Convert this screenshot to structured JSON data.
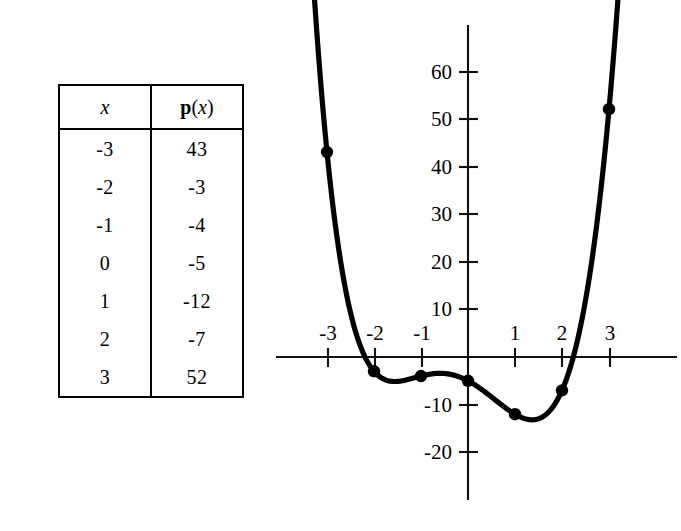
{
  "table": {
    "headers": [
      "x",
      "p(x)"
    ],
    "header_x": "x",
    "header_p_bold": "p",
    "header_p_open": "(",
    "header_p_var": "x",
    "header_p_close": ")",
    "rows": [
      {
        "x": "-3",
        "p": "43"
      },
      {
        "x": "-2",
        "p": "-3"
      },
      {
        "x": "-1",
        "p": "-4"
      },
      {
        "x": "0",
        "p": "-5"
      },
      {
        "x": "1",
        "p": "-12"
      },
      {
        "x": "2",
        "p": "-7"
      },
      {
        "x": "3",
        "p": "52"
      }
    ]
  },
  "graph": {
    "x_tick_labels": [
      "-3",
      "-2",
      "-1",
      "1",
      "2",
      "3"
    ],
    "y_tick_labels": [
      "60",
      "50",
      "40",
      "30",
      "20",
      "10",
      "-10",
      "-20"
    ],
    "axis_color": "#111111",
    "curve_color": "#000000"
  },
  "chart_data": {
    "type": "line",
    "title": "",
    "xlabel": "",
    "ylabel": "",
    "x": [
      -3,
      -2,
      -1,
      0,
      1,
      2,
      3
    ],
    "values": [
      43,
      -3,
      -4,
      -5,
      -12,
      -7,
      52
    ],
    "series": [
      {
        "name": "p(x)",
        "values": [
          43,
          -3,
          -4,
          -5,
          -12,
          -7,
          52
        ]
      }
    ],
    "categories": [
      "-3",
      "-2",
      "-1",
      "0",
      "1",
      "2",
      "3"
    ],
    "xlim": [
      -4.1,
      3.9
    ],
    "ylim": [
      -28,
      71
    ],
    "x_ticks": [
      -3,
      -2,
      -1,
      1,
      2,
      3
    ],
    "y_ticks": [
      -20,
      -10,
      10,
      20,
      30,
      40,
      50,
      60
    ],
    "grid": false,
    "legend": "none",
    "markers": true,
    "marker_shape": "circle"
  }
}
